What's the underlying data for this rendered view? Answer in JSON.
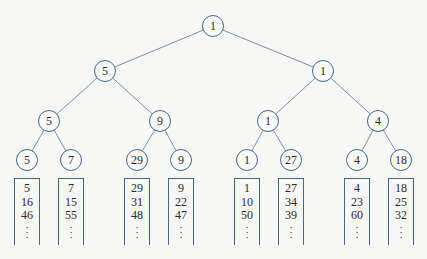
{
  "diagram": {
    "type": "tournament-tree",
    "colors": {
      "stroke": "#41688f",
      "edge": "#7a93ad",
      "text": "#2a2a2a",
      "background": "#f7f7f5"
    },
    "nodes": [
      {
        "id": "n0",
        "label": "1",
        "x": 213,
        "y": 26,
        "level": 0
      },
      {
        "id": "n1",
        "label": "5",
        "x": 105,
        "y": 71,
        "level": 1
      },
      {
        "id": "n2",
        "label": "1",
        "x": 323,
        "y": 71,
        "level": 1
      },
      {
        "id": "n3",
        "label": "5",
        "x": 49,
        "y": 121,
        "level": 2
      },
      {
        "id": "n4",
        "label": "9",
        "x": 160,
        "y": 121,
        "level": 2
      },
      {
        "id": "n5",
        "label": "1",
        "x": 268,
        "y": 121,
        "level": 2
      },
      {
        "id": "n6",
        "label": "4",
        "x": 378,
        "y": 121,
        "level": 2
      },
      {
        "id": "n7",
        "label": "5",
        "x": 27,
        "y": 160,
        "level": 3
      },
      {
        "id": "n8",
        "label": "7",
        "x": 71,
        "y": 160,
        "level": 3
      },
      {
        "id": "n9",
        "label": "29",
        "x": 137,
        "y": 160,
        "level": 3
      },
      {
        "id": "n10",
        "label": "9",
        "x": 181,
        "y": 160,
        "level": 3
      },
      {
        "id": "n11",
        "label": "1",
        "x": 247,
        "y": 160,
        "level": 3
      },
      {
        "id": "n12",
        "label": "27",
        "x": 291,
        "y": 160,
        "level": 3
      },
      {
        "id": "n13",
        "label": "4",
        "x": 357,
        "y": 160,
        "level": 3
      },
      {
        "id": "n14",
        "label": "18",
        "x": 401,
        "y": 160,
        "level": 3
      }
    ],
    "edges": [
      [
        "n0",
        "n1"
      ],
      [
        "n0",
        "n2"
      ],
      [
        "n1",
        "n3"
      ],
      [
        "n1",
        "n4"
      ],
      [
        "n2",
        "n5"
      ],
      [
        "n2",
        "n6"
      ],
      [
        "n3",
        "n7"
      ],
      [
        "n3",
        "n8"
      ],
      [
        "n4",
        "n9"
      ],
      [
        "n4",
        "n10"
      ],
      [
        "n5",
        "n11"
      ],
      [
        "n5",
        "n12"
      ],
      [
        "n6",
        "n13"
      ],
      [
        "n6",
        "n14"
      ]
    ],
    "lists": [
      {
        "x": 27,
        "values": [
          "5",
          "16",
          "46"
        ],
        "ellipsis": "⋮"
      },
      {
        "x": 71,
        "values": [
          "7",
          "15",
          "55"
        ],
        "ellipsis": "⋮"
      },
      {
        "x": 137,
        "values": [
          "29",
          "31",
          "48"
        ],
        "ellipsis": "⋮"
      },
      {
        "x": 181,
        "values": [
          "9",
          "22",
          "47"
        ],
        "ellipsis": "⋮"
      },
      {
        "x": 247,
        "values": [
          "1",
          "10",
          "50"
        ],
        "ellipsis": "⋮"
      },
      {
        "x": 291,
        "values": [
          "27",
          "34",
          "39"
        ],
        "ellipsis": "⋮"
      },
      {
        "x": 357,
        "values": [
          "4",
          "23",
          "60"
        ],
        "ellipsis": "⋮"
      },
      {
        "x": 401,
        "values": [
          "18",
          "25",
          "32"
        ],
        "ellipsis": "⋮"
      }
    ],
    "list_top_y": 178
  }
}
